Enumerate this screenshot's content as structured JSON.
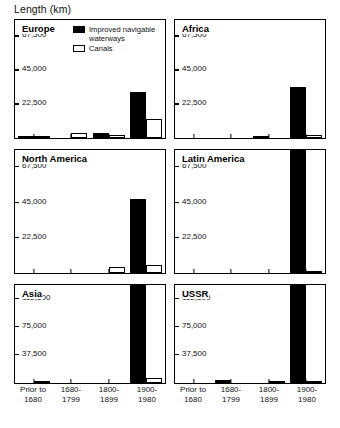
{
  "chart_title": "Length (km)",
  "legend": {
    "position": "inside-top-left-of-first-panel",
    "entries": [
      {
        "key": "improved",
        "label": "Improved navigable\nwaterways",
        "color": "#000000"
      },
      {
        "key": "canals",
        "label": "Canals",
        "color": "#ffffff"
      }
    ]
  },
  "xaxis": {
    "categories": [
      "Prior to\n1680",
      "1680-\n1799",
      "1800-\n1899",
      "1900-\n1980"
    ],
    "category_labels_flat": [
      "Prior to 1680",
      "1680-1799",
      "1800-1899",
      "1900-1980"
    ]
  },
  "chart_data": {
    "type": "bar",
    "title": "Length (km)",
    "xlabel": "",
    "ylabel": "Length (km)",
    "grid": false,
    "legend_position": "top-left inside Europe panel",
    "categories": [
      "Prior to 1680",
      "1680-1799",
      "1800-1899",
      "1900-1980"
    ],
    "series_names": [
      "Improved navigable waterways",
      "Canals"
    ],
    "panels": [
      {
        "name": "Europe",
        "ylim": [
          0,
          78000
        ],
        "yticks": [
          22500,
          45000,
          67500
        ],
        "ytick_labels": [
          "22,500",
          "45,000",
          "67,500"
        ],
        "series": [
          {
            "name": "Improved navigable waterways",
            "values": [
              600,
              0,
              3500,
              30500
            ]
          },
          {
            "name": "Canals",
            "values": [
              400,
              3000,
              2200,
              12500
            ]
          }
        ]
      },
      {
        "name": "Africa",
        "ylim": [
          0,
          78000
        ],
        "yticks": [
          22500,
          45000,
          67500
        ],
        "ytick_labels": [
          "22,500",
          "45,000",
          "67,500"
        ],
        "series": [
          {
            "name": "Improved navigable waterways",
            "values": [
              0,
              0,
              1500,
              33500
            ]
          },
          {
            "name": "Canals",
            "values": [
              0,
              0,
              0,
              2000
            ]
          }
        ]
      },
      {
        "name": "North America",
        "ylim": [
          0,
          78000
        ],
        "yticks": [
          22500,
          45000,
          67500
        ],
        "ytick_labels": [
          "22,500",
          "45,000",
          "67,500"
        ],
        "series": [
          {
            "name": "Improved navigable waterways",
            "values": [
              0,
              0,
              0,
              47000
            ]
          },
          {
            "name": "Canals",
            "values": [
              0,
              0,
              4000,
              5000
            ]
          }
        ]
      },
      {
        "name": "Latin America",
        "ylim": [
          0,
          78000
        ],
        "yticks": [
          22500,
          45000,
          67500
        ],
        "ytick_labels": [
          "22,500",
          "45,000",
          "67,500"
        ],
        "clipped_bars": [
          "1900-1980 improved navigable waterways exceeds axis top"
        ],
        "series": [
          {
            "name": "Improved navigable waterways",
            "values": [
              0,
              0,
              0,
              86000
            ]
          },
          {
            "name": "Canals",
            "values": [
              0,
              0,
              0,
              1200
            ]
          }
        ]
      },
      {
        "name": "Asia",
        "ylim": [
          0,
          130000
        ],
        "yticks": [
          37500,
          75000,
          112500
        ],
        "ytick_labels": [
          "37,500",
          "75,000",
          "112,500"
        ],
        "clipped_bars": [
          "1900-1980 improved navigable waterways exceeds axis top"
        ],
        "series": [
          {
            "name": "Improved navigable waterways",
            "values": [
              0,
              0,
              0,
              140000
            ]
          },
          {
            "name": "Canals",
            "values": [
              2500,
              0,
              0,
              7000
            ]
          }
        ]
      },
      {
        "name": "USSR",
        "ylim": [
          0,
          130000
        ],
        "yticks": [
          37500,
          75000,
          112500
        ],
        "ytick_labels": [
          "37,500",
          "75,000",
          "112,500"
        ],
        "clipped_bars": [
          "1900-1980 improved navigable waterways exceeds axis top"
        ],
        "series": [
          {
            "name": "Improved navigable waterways",
            "values": [
              0,
              3500,
              0,
              140000
            ]
          },
          {
            "name": "Canals",
            "values": [
              0,
              0,
              2500,
              3000
            ]
          }
        ]
      }
    ]
  }
}
